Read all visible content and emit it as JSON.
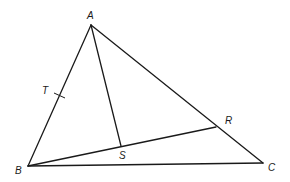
{
  "diagram": {
    "type": "geometry-triangle",
    "points": {
      "A": {
        "label": "A",
        "x": 91,
        "y": 25,
        "label_x": 87,
        "label_y": 19
      },
      "B": {
        "label": "B",
        "x": 28,
        "y": 166,
        "label_x": 15,
        "label_y": 174
      },
      "C": {
        "label": "C",
        "x": 263,
        "y": 163,
        "label_x": 268,
        "label_y": 171
      },
      "R": {
        "label": "R",
        "x": 216,
        "y": 127,
        "label_x": 225,
        "label_y": 124
      },
      "S": {
        "label": "S",
        "x": 121,
        "y": 146,
        "label_x": 119,
        "label_y": 159
      },
      "T": {
        "label": "T",
        "x": 59.5,
        "y": 95.5,
        "label_x": 42,
        "label_y": 94
      }
    },
    "segments": [
      {
        "from": "A",
        "to": "B"
      },
      {
        "from": "A",
        "to": "C"
      },
      {
        "from": "B",
        "to": "C"
      },
      {
        "from": "A",
        "to": "S"
      },
      {
        "from": "B",
        "to": "R"
      }
    ],
    "marks": [
      {
        "type": "midpoint-tick",
        "on": "AB",
        "at": "T"
      }
    ],
    "colors": {
      "line": "#1a1a1a",
      "background": "#ffffff"
    }
  }
}
